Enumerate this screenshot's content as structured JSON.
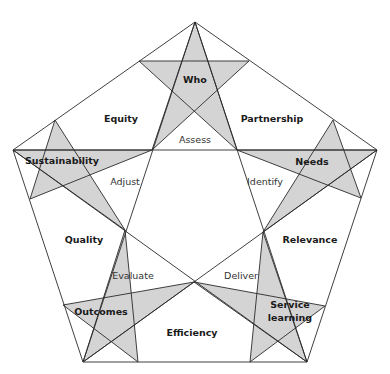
{
  "diagram": {
    "type": "pentagon with inscribed pentagram and vertex stars",
    "colors": {
      "star_fill": "#d4d4d4",
      "line": "#2a2a2a",
      "background": "#ffffff"
    },
    "vertex_stars": [
      {
        "id": "who",
        "label": "Who"
      },
      {
        "id": "needs",
        "label": "Needs"
      },
      {
        "id": "service_learning",
        "label_line1": "Service",
        "label_line2": "learning"
      },
      {
        "id": "outcomes",
        "label": "Outcomes"
      },
      {
        "id": "sustainability",
        "label": "Sustainability"
      }
    ],
    "outer_regions": [
      {
        "id": "equity",
        "label": "Equity"
      },
      {
        "id": "partnership",
        "label": "Partnership"
      },
      {
        "id": "relevance",
        "label": "Relevance"
      },
      {
        "id": "efficiency",
        "label": "Efficiency"
      },
      {
        "id": "quality",
        "label": "Quality"
      }
    ],
    "process_steps": [
      {
        "id": "assess",
        "label": "Assess"
      },
      {
        "id": "identify",
        "label": "Identify"
      },
      {
        "id": "deliver",
        "label": "Deliver"
      },
      {
        "id": "evaluate",
        "label": "Evaluate"
      },
      {
        "id": "adjust",
        "label": "Adjust"
      }
    ]
  }
}
